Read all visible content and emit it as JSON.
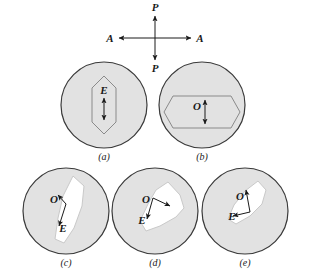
{
  "figure": {
    "type": "optical-indicatrix-diagram",
    "background_color": "#ffffff",
    "circle_fill": "#e2e2e2",
    "circle_stroke": "#3a3a3a",
    "blob_fill": "#ffffff",
    "blob_stroke": "#c9c9c9",
    "hexagon_stroke": "#8a8a8a",
    "arrow_color": "#1a1a1a"
  },
  "crosshair": {
    "name": "polarizer-analyzer-cross",
    "center_x": 155,
    "center_y": 38,
    "vertical_label_top": "P",
    "vertical_label_bottom": "P",
    "horizontal_label_left": "A",
    "horizontal_label_right": "A",
    "arm_length_vertical": 22,
    "arm_length_horizontal": 36
  },
  "panels": [
    {
      "id": "a",
      "caption": "(a)",
      "cx": 104,
      "cy": 105,
      "r": 43,
      "caption_x": 104,
      "caption_y": 160,
      "shape": "hexagon-vertical",
      "shape_points": "104,76 116,88 116,122 104,134 92,122 92,88",
      "label": "E",
      "label_x": 104,
      "label_y": 94,
      "arrow": {
        "kind": "double-vertical",
        "x": 104,
        "y_top": 98,
        "y_bottom": 120
      }
    },
    {
      "id": "b",
      "caption": "(b)",
      "cx": 202,
      "cy": 105,
      "r": 43,
      "caption_x": 202,
      "caption_y": 160,
      "shape": "hexagon-horizontal",
      "shape_points": "173,96 231,96 240,112 231,128 173,128 164,112",
      "label": "O",
      "label_x": 197,
      "label_y": 110,
      "arrow": {
        "kind": "double-vertical",
        "x": 205,
        "y_top": 100,
        "y_bottom": 124
      }
    },
    {
      "id": "c",
      "caption": "(c)",
      "cx": 66,
      "cy": 211,
      "r": 43,
      "caption_x": 66,
      "caption_y": 266,
      "shape": "blob",
      "blob_points": "73,176 84,186 82,206 74,228 64,243 55,239 58,218 63,196",
      "label_o": "O",
      "label_o_x": 54,
      "label_o_y": 203,
      "label_e": "E",
      "label_e_x": 63,
      "label_e_y": 232,
      "arrow_o": {
        "x1": 66,
        "y1": 204,
        "x2": 58,
        "y2": 195
      },
      "arrow_e": {
        "x1": 66,
        "y1": 204,
        "x2": 59,
        "y2": 226
      }
    },
    {
      "id": "d",
      "caption": "(d)",
      "cx": 155,
      "cy": 211,
      "r": 43,
      "caption_x": 155,
      "caption_y": 266,
      "shape": "blob",
      "blob_points": "168,182 180,195 184,208 176,217 160,226 146,231 140,221 148,204 156,190",
      "label_o": "O",
      "label_o_x": 146,
      "label_o_y": 203,
      "label_e": "E",
      "label_e_x": 142,
      "label_e_y": 224,
      "arrow_o": {
        "x1": 153,
        "y1": 198,
        "x2": 170,
        "y2": 206
      },
      "arrow_e": {
        "x1": 153,
        "y1": 198,
        "x2": 147,
        "y2": 219
      }
    },
    {
      "id": "e",
      "caption": "(e)",
      "cx": 245,
      "cy": 211,
      "r": 43,
      "caption_x": 245,
      "caption_y": 266,
      "shape": "blob",
      "blob_points": "258,181 266,190 262,204 250,216 236,224 228,219 234,205 245,191",
      "label_o": "O",
      "label_o_x": 240,
      "label_o_y": 200,
      "label_e": "E",
      "label_e_x": 232,
      "label_e_y": 220,
      "arrow_o": {
        "x1": 250,
        "y1": 212,
        "x2": 246,
        "y2": 190
      },
      "arrow_e": {
        "x1": 250,
        "y1": 212,
        "x2": 233,
        "y2": 216
      }
    }
  ]
}
